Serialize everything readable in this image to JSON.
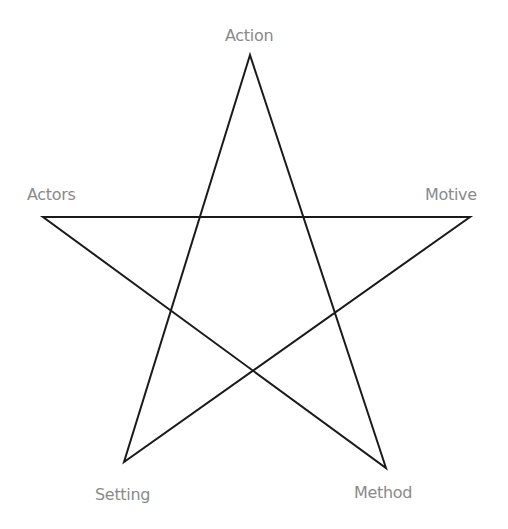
{
  "diagram": {
    "type": "pentagram",
    "stroke_color": "#1a1a1a",
    "label_color": "#8a8a8a",
    "vertices": [
      {
        "id": "action",
        "label": "Action",
        "x": 250,
        "y": 55
      },
      {
        "id": "method",
        "label": "Method",
        "x": 386,
        "y": 468
      },
      {
        "id": "actors",
        "label": "Actors",
        "x": 43,
        "y": 217
      },
      {
        "id": "motive",
        "label": "Motive",
        "x": 470,
        "y": 217
      },
      {
        "id": "setting",
        "label": "Setting",
        "x": 124,
        "y": 462
      }
    ],
    "edges": [
      [
        "action",
        "method"
      ],
      [
        "method",
        "actors"
      ],
      [
        "actors",
        "motive"
      ],
      [
        "motive",
        "setting"
      ],
      [
        "setting",
        "action"
      ]
    ]
  },
  "labels": {
    "action": "Action",
    "actors": "Actors",
    "motive": "Motive",
    "setting": "Setting",
    "method": "Method"
  }
}
